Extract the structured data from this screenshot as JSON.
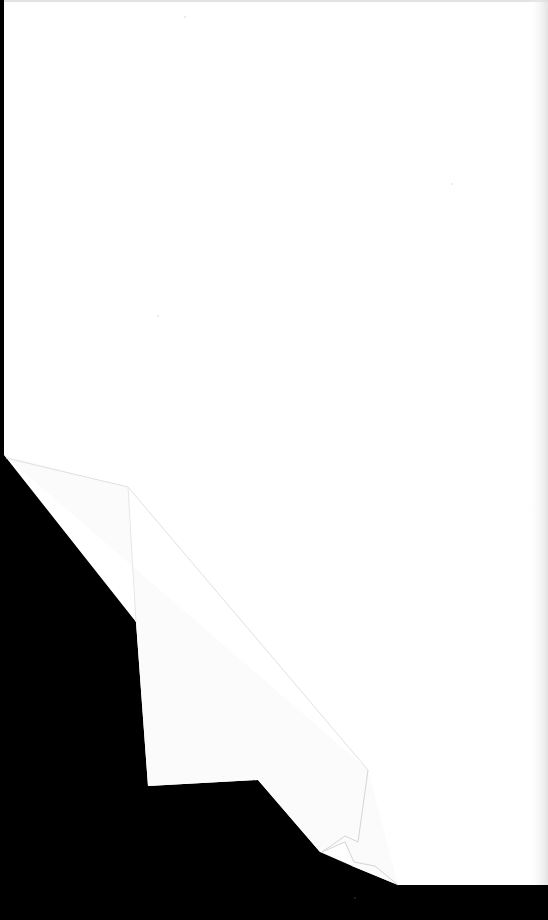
{
  "document": {
    "type": "blank-scanned-page",
    "text_content": [],
    "colors": {
      "background": "#000000",
      "paper": "#ffffff",
      "paper_edge_shadow": "#e6e6e6",
      "fold_crease": "#d9d9d9",
      "top_smudge": "#bdbdbd"
    }
  }
}
